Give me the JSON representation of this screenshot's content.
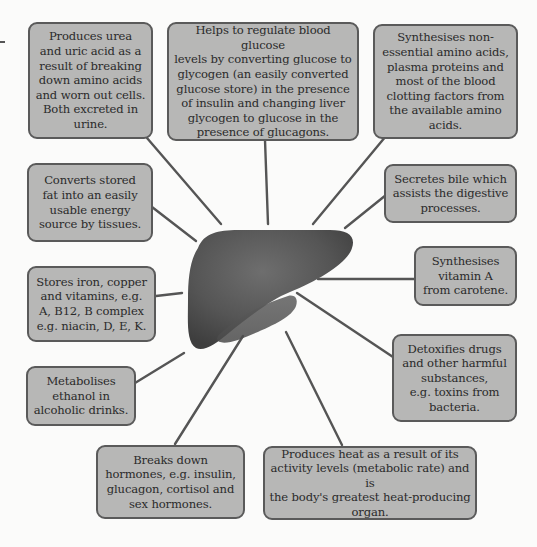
{
  "diagram": {
    "center": {
      "label": "liver",
      "color": "#555555"
    },
    "colors": {
      "box_fill": "#b7b7b6",
      "box_border": "#5a5a5a",
      "connector": "#555555",
      "background": "#fbfbfa"
    },
    "functions": [
      {
        "id": "urea",
        "text": "Produces urea\nand uric acid as a\nresult of breaking\ndown amino acids\nand worn out cells.\nBoth excreted in\nurine."
      },
      {
        "id": "glucose",
        "text": "Helps to regulate blood glucose\nlevels by converting glucose to\nglycogen (an easily converted\nglucose store) in the presence\nof insulin and changing liver\nglycogen to glucose in the\npresence of glucagons."
      },
      {
        "id": "amino",
        "text": "Synthesises non-\nessential amino acids,\nplasma proteins and\nmost of the blood\nclotting factors from\nthe available amino\nacids."
      },
      {
        "id": "fat",
        "text": "Converts stored\nfat into an easily\nusable energy\nsource by tissues."
      },
      {
        "id": "bile",
        "text": "Secretes bile which\nassists the digestive\nprocesses."
      },
      {
        "id": "iron",
        "text": "Stores iron, copper\nand vitamins, e.g.\nA, B12, B complex\ne.g. niacin, D, E, K."
      },
      {
        "id": "vitamin-a",
        "text": "Synthesises\nvitamin A\nfrom carotene."
      },
      {
        "id": "ethanol",
        "text": "Metabolises\nethanol in\nalcoholic drinks."
      },
      {
        "id": "detox",
        "text": "Detoxifies drugs\nand other harmful\nsubstances,\ne.g. toxins from\nbacteria."
      },
      {
        "id": "hormones",
        "text": "Breaks down\nhormones, e.g. insulin,\nglucagon, cortisol and\nsex hormones."
      },
      {
        "id": "heat",
        "text": "Produces heat as a result of its\nactivity levels (metabolic rate) and is\nthe body's greatest heat-producing\norgan."
      }
    ]
  }
}
